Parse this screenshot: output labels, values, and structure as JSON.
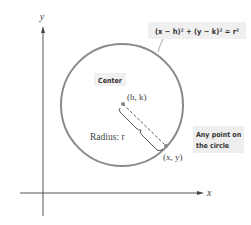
{
  "diagram": {
    "title_equation": "(x − h)² + (y − k)² = r²",
    "axes": {
      "x_label": "x",
      "y_label": "y"
    },
    "labels": {
      "center_caption": "Center",
      "center_point": "(h, k)",
      "radius": "Radius: r",
      "point_caption_line1": "Any point on",
      "point_caption_line2": "the circle",
      "point_on_circle": "(x, y)"
    },
    "colors": {
      "circle": "#8a8a8a",
      "axes": "#555555",
      "caption_box": "#eeeeee",
      "text": "#333333"
    }
  }
}
